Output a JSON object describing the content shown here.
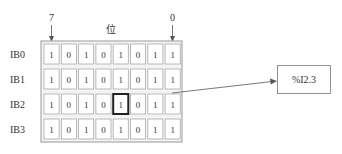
{
  "diagram": {
    "bit_high_label": "7",
    "bit_low_label": "0",
    "bit_axis_label": "位",
    "rows": [
      {
        "label": "IB0",
        "bits": [
          "1",
          "0",
          "1",
          "0",
          "1",
          "0",
          "1",
          "1"
        ]
      },
      {
        "label": "IB1",
        "bits": [
          "1",
          "0",
          "1",
          "0",
          "1",
          "0",
          "1",
          "1"
        ]
      },
      {
        "label": "IB2",
        "bits": [
          "1",
          "0",
          "1",
          "0",
          "1",
          "0",
          "1",
          "1"
        ]
      },
      {
        "label": "IB3",
        "bits": [
          "1",
          "0",
          "1",
          "0",
          "1",
          "0",
          "1",
          "1"
        ]
      }
    ],
    "highlighted": {
      "row": 2,
      "bit_index_from_left": 4
    },
    "address_label": "%I2.3",
    "colors": {
      "line": "#555555",
      "frame": "#999999",
      "highlight": "#222222"
    }
  }
}
